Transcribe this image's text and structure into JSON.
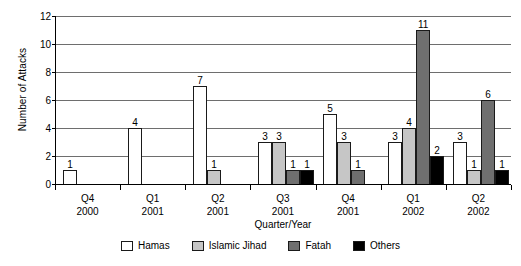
{
  "chart_data": {
    "type": "bar",
    "title": "",
    "xlabel": "Quarter/Year",
    "ylabel": "Number of Attacks",
    "ylim": [
      0,
      12
    ],
    "yticks": [
      0,
      2,
      4,
      6,
      8,
      10,
      12
    ],
    "grid": true,
    "legend_position": "bottom",
    "categories": [
      {
        "quarter": "Q4",
        "year": "2000"
      },
      {
        "quarter": "Q1",
        "year": "2001"
      },
      {
        "quarter": "Q2",
        "year": "2001"
      },
      {
        "quarter": "Q3",
        "year": "2001"
      },
      {
        "quarter": "Q4",
        "year": "2001"
      },
      {
        "quarter": "Q1",
        "year": "2002"
      },
      {
        "quarter": "Q2",
        "year": "2002"
      }
    ],
    "series": [
      {
        "name": "Hamas",
        "color": "#ffffff",
        "values": [
          1,
          4,
          7,
          3,
          5,
          3,
          3
        ]
      },
      {
        "name": "Islamic Jihad",
        "color": "#c6c6c6",
        "values": [
          null,
          null,
          1,
          3,
          3,
          4,
          1
        ]
      },
      {
        "name": "Fatah",
        "color": "#6f6f6f",
        "values": [
          null,
          null,
          null,
          1,
          1,
          11,
          6
        ]
      },
      {
        "name": "Others",
        "color": "#000000",
        "values": [
          null,
          null,
          null,
          1,
          null,
          2,
          1
        ]
      }
    ]
  }
}
